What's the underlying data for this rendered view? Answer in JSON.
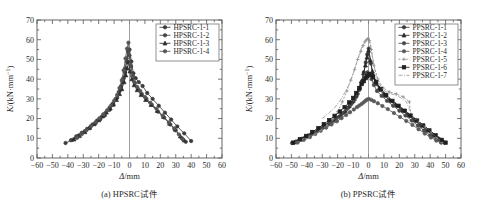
{
  "figure": {
    "background": "#ffffff",
    "axis_color": "#555555",
    "panels": [
      {
        "id": "panel-a",
        "caption": "(a) HPSRC试件",
        "chart_index": 0
      },
      {
        "id": "panel-b",
        "caption": "(b) PPSRC试件",
        "chart_index": 1
      }
    ]
  },
  "chart_data": [
    {
      "type": "line",
      "title": "",
      "subtitle": "",
      "xlabel": "Δ/mm",
      "ylabel": "K/(kN·mm⁻¹)",
      "ylabel_parts": {
        "italic": "K",
        "rest": "/(kN·mm",
        "sup": "−1",
        "close": ")"
      },
      "xlim": [
        -60,
        60
      ],
      "ylim": [
        0,
        70
      ],
      "xticks": [
        -60,
        -50,
        -40,
        -30,
        -20,
        -10,
        0,
        10,
        20,
        30,
        40,
        50,
        60
      ],
      "yticks": [
        0,
        10,
        20,
        30,
        40,
        50,
        60,
        70
      ],
      "xtick_labels": [
        "−60",
        "−50",
        "−40",
        "−30",
        "−20",
        "−10",
        "0",
        "10",
        "20",
        "30",
        "40",
        "50",
        "60"
      ],
      "ytick_labels": [
        "0",
        "10",
        "20",
        "30",
        "40",
        "50",
        "60",
        "70"
      ],
      "minor_ticks": true,
      "grid": false,
      "zero_vline": 0,
      "legend_position": "top-right",
      "series": [
        {
          "name": "HPSRC-1-1",
          "color": "#3a3a3a",
          "marker": "circle",
          "dash": "none",
          "x": [
            -41.5,
            -37,
            -33,
            -29,
            -25.5,
            -22,
            -19,
            -16,
            -13,
            -10.5,
            -8,
            -6,
            -4.5,
            -3,
            -1.8,
            -0.9,
            0,
            1.2,
            2.5,
            4,
            6,
            8.5,
            11.5,
            15,
            19,
            23,
            27,
            31,
            35.5,
            40
          ],
          "y": [
            7.6,
            9.2,
            11.4,
            13.6,
            15.6,
            17.6,
            19.6,
            21.6,
            24.4,
            27.0,
            30.5,
            34.5,
            38.5,
            43.5,
            49.0,
            54.0,
            55.0,
            49.0,
            43.0,
            40.5,
            38.5,
            36.5,
            33.0,
            30.0,
            26.5,
            23.0,
            19.5,
            16.0,
            12.5,
            8.6
          ]
        },
        {
          "name": "HPSRC-1-2",
          "color": "#444444",
          "marker": "circle",
          "dash": "none",
          "x": [
            -38,
            -34.5,
            -31,
            -27.5,
            -24,
            -21,
            -18,
            -15.5,
            -13,
            -11,
            -9,
            -7,
            -5.5,
            -4,
            -2.8,
            -1.8,
            -1.0,
            0,
            1.0,
            2.2,
            3.5,
            5.5,
            8,
            11,
            14.5,
            18.5,
            22.5,
            26.5,
            30,
            34,
            36.5
          ],
          "y": [
            9.0,
            11.0,
            12.8,
            14.8,
            17.0,
            19.0,
            21.0,
            23.0,
            25.5,
            27.5,
            30.0,
            33.5,
            36.5,
            40.5,
            45.5,
            50.5,
            54.5,
            52.0,
            46.5,
            41.0,
            38.0,
            35.0,
            32.5,
            30.0,
            27.0,
            23.5,
            20.5,
            17.0,
            14.0,
            10.0,
            8.2
          ]
        },
        {
          "name": "HPSRC-1-3",
          "color": "#2e2e2e",
          "marker": "triangle",
          "dash": "none",
          "x": [
            -36,
            -32.5,
            -29,
            -26,
            -23,
            -20,
            -17.5,
            -15,
            -12.5,
            -10.5,
            -8.5,
            -6.5,
            -5,
            -3.5,
            -2.4,
            -1.5,
            -0.6,
            0.3,
            1.5,
            3,
            5,
            7.5,
            10.5,
            14,
            18,
            22,
            26,
            29.5,
            33,
            35.5
          ],
          "y": [
            9.5,
            11.2,
            13.2,
            15.2,
            17.2,
            19.2,
            21.2,
            23.2,
            25.2,
            27.2,
            29.5,
            32.5,
            35.0,
            38.5,
            42.0,
            45.5,
            48.5,
            44.0,
            40.0,
            37.0,
            34.5,
            32.0,
            29.5,
            27.0,
            24.0,
            21.0,
            17.5,
            14.5,
            11.0,
            9.0
          ]
        },
        {
          "name": "HPSRC-1-4",
          "color": "#555555",
          "marker": "circle",
          "dash": "none",
          "x": [
            -34,
            -31,
            -28,
            -25,
            -22,
            -19.5,
            -17,
            -14.5,
            -12,
            -10,
            -8,
            -6.5,
            -5,
            -3.8,
            -2.6,
            -1.6,
            -0.7,
            0.5,
            1.8,
            3.2,
            5,
            7,
            10,
            13.5,
            17.5,
            21.5,
            25.5,
            29,
            32,
            34.5
          ],
          "y": [
            10.2,
            12.0,
            14.0,
            16.2,
            18.2,
            20.2,
            22.2,
            24.2,
            26.5,
            29.0,
            32.0,
            35.5,
            39.5,
            44.5,
            50.5,
            55.5,
            58.5,
            47.5,
            41.5,
            38.5,
            36.0,
            34.0,
            31.0,
            28.0,
            25.0,
            21.5,
            18.0,
            15.0,
            12.0,
            9.5
          ]
        }
      ],
      "legend_entries": [
        "HPSRC-1-1",
        "HPSRC-1-2",
        "HPSRC-1-3",
        "HPSRC-1-4"
      ]
    },
    {
      "type": "line",
      "title": "",
      "subtitle": "",
      "xlabel": "Δ/mm",
      "ylabel": "K/(kN·mm⁻¹)",
      "ylabel_parts": {
        "italic": "K",
        "rest": "/(kN·mm",
        "sup": "−1",
        "close": ")"
      },
      "xlim": [
        -60,
        60
      ],
      "ylim": [
        0,
        70
      ],
      "xticks": [
        -60,
        -50,
        -40,
        -30,
        -20,
        -10,
        0,
        10,
        20,
        30,
        40,
        50,
        60
      ],
      "yticks": [
        0,
        10,
        20,
        30,
        40,
        50,
        60,
        70
      ],
      "xtick_labels": [
        "−60",
        "−50",
        "−40",
        "−30",
        "−20",
        "−10",
        "0",
        "10",
        "20",
        "30",
        "40",
        "50",
        "60"
      ],
      "ytick_labels": [
        "0",
        "10",
        "20",
        "30",
        "40",
        "50",
        "60",
        "70"
      ],
      "minor_ticks": true,
      "grid": false,
      "zero_vline": 0,
      "legend_position": "top-right",
      "series": [
        {
          "name": "PPSRC-1-1",
          "color": "#3a3a3a",
          "marker": "circle",
          "dash": "none",
          "x": [
            -49.5,
            -45,
            -41,
            -37,
            -33,
            -29.5,
            -26,
            -22.5,
            -19,
            -16,
            -13,
            -10.5,
            -8,
            -6,
            -4.5,
            -3,
            -1.8,
            -0.8,
            0.2,
            1.5,
            3,
            5,
            7.5,
            10.5,
            14,
            18,
            22,
            26,
            30,
            34,
            38,
            42,
            46,
            49.5
          ],
          "y": [
            7.6,
            9.0,
            10.5,
            12.0,
            13.8,
            15.5,
            17.2,
            19.0,
            21.0,
            23.0,
            25.5,
            28.0,
            31.0,
            34.5,
            38.5,
            43.5,
            48.5,
            52.5,
            55.5,
            48.0,
            42.0,
            37.5,
            34.5,
            31.5,
            29.0,
            26.5,
            24.0,
            21.5,
            19.0,
            16.5,
            14.0,
            11.5,
            9.5,
            7.8
          ]
        },
        {
          "name": "PPSRC-1-2",
          "color": "#2b2b2b",
          "marker": "triangle",
          "dash": "none",
          "x": [
            -48,
            -44,
            -40,
            -36,
            -32,
            -28.5,
            -25,
            -21.5,
            -18,
            -15,
            -12.5,
            -10,
            -8,
            -6,
            -4.5,
            -3.2,
            -2,
            -1,
            0,
            1.2,
            2.5,
            4.5,
            7,
            10,
            13.5,
            17.5,
            21.5,
            25.5,
            29.5,
            33.5,
            37.5,
            41.5,
            45.5,
            48.5
          ],
          "y": [
            8.0,
            9.4,
            11.0,
            12.8,
            14.5,
            16.2,
            18.0,
            20.0,
            22.0,
            24.0,
            26.5,
            29.0,
            32.0,
            35.5,
            39.0,
            43.0,
            47.0,
            51.0,
            54.5,
            49.5,
            44.0,
            39.0,
            35.5,
            32.5,
            29.5,
            27.0,
            24.5,
            22.0,
            19.5,
            17.0,
            14.5,
            12.0,
            9.8,
            8.2
          ]
        },
        {
          "name": "PPSRC-1-3",
          "color": "#4a4a4a",
          "marker": "circle",
          "dash": "none",
          "x": [
            -47,
            -43,
            -39,
            -35,
            -31,
            -27.5,
            -24,
            -20.5,
            -17,
            -14,
            -11.5,
            -9,
            -7,
            -5.5,
            -4,
            -2.8,
            -1.6,
            -0.6,
            0.5,
            2,
            3.5,
            5.5,
            8.5,
            12,
            16,
            20,
            24,
            28,
            32,
            36,
            40,
            44,
            47.5
          ],
          "y": [
            8.4,
            9.8,
            11.4,
            13.0,
            14.8,
            16.5,
            18.4,
            20.4,
            22.5,
            24.8,
            27.0,
            29.5,
            32.5,
            35.5,
            38.0,
            40.5,
            42.5,
            43.5,
            42.5,
            40.0,
            37.0,
            34.0,
            31.5,
            29.0,
            26.5,
            24.0,
            21.5,
            19.0,
            16.5,
            14.0,
            11.5,
            9.4,
            8.0
          ]
        },
        {
          "name": "PPSRC-1-4",
          "color": "#5a5a5a",
          "marker": "circle",
          "dash": "none",
          "x": [
            -46,
            -42,
            -38,
            -34.5,
            -31,
            -27.5,
            -24,
            -20.5,
            -17.5,
            -14.5,
            -12,
            -9.5,
            -7.5,
            -6,
            -4.5,
            -3.2,
            -2,
            -1,
            0.2,
            1.8,
            3.5,
            6,
            9,
            12.5,
            16.5,
            20.5,
            24.5,
            28.5,
            32.5,
            36.5,
            40.5,
            44,
            47
          ],
          "y": [
            7.8,
            9.2,
            10.6,
            12.2,
            13.8,
            15.4,
            17.0,
            18.6,
            20.2,
            21.8,
            23.2,
            24.6,
            25.8,
            26.6,
            27.4,
            28.2,
            29.0,
            29.6,
            30.0,
            29.5,
            28.8,
            27.8,
            26.4,
            24.8,
            22.8,
            20.8,
            18.8,
            16.8,
            14.6,
            12.4,
            10.4,
            8.8,
            7.8
          ]
        },
        {
          "name": "PPSRC-1-5",
          "color": "#8a8a8a",
          "marker": "plus",
          "dash": "2,1.6",
          "x": [
            -50,
            -45,
            -40,
            -35,
            -31,
            -27,
            -23.5,
            -20,
            -17,
            -14,
            -11.5,
            -9,
            -7,
            -5,
            -3.5,
            -2.2,
            -1.2,
            -0.3,
            0.6,
            1.8,
            3.5,
            6,
            9.5,
            13.5,
            18,
            22.5,
            26.5,
            27.5,
            31,
            35,
            39.5,
            44,
            48
          ],
          "y": [
            7.4,
            8.8,
            10.2,
            12.0,
            14.0,
            16.5,
            19.5,
            23.5,
            28.5,
            34.0,
            39.5,
            45.0,
            50.0,
            54.0,
            57.0,
            59.0,
            60.0,
            60.5,
            59.5,
            55.0,
            47.0,
            40.0,
            35.5,
            33.5,
            32.5,
            31.0,
            28.5,
            22.0,
            19.5,
            16.5,
            13.5,
            10.5,
            8.2
          ]
        },
        {
          "name": "PPSRC-1-6",
          "color": "#1f1f1f",
          "marker": "square",
          "dash": "none",
          "x": [
            -49,
            -44.5,
            -40.5,
            -36.5,
            -32.5,
            -29,
            -25.5,
            -22,
            -18.5,
            -15.5,
            -12.5,
            -10,
            -8,
            -6,
            -4.5,
            -3,
            -1.8,
            -0.8,
            0.4,
            1.6,
            3,
            5,
            8,
            11.5,
            15.5,
            19.5,
            23.5,
            27.5,
            31.5,
            35.5,
            39.5,
            43.5,
            47.5,
            50
          ],
          "y": [
            7.8,
            9.6,
            11.2,
            13.2,
            15.2,
            17.2,
            19.2,
            21.4,
            23.6,
            25.8,
            28.2,
            30.5,
            33.0,
            35.5,
            37.5,
            39.0,
            40.5,
            41.5,
            42.5,
            42.0,
            41.0,
            38.5,
            35.0,
            32.0,
            29.0,
            26.5,
            24.0,
            21.5,
            19.0,
            16.5,
            14.0,
            11.5,
            9.2,
            7.8
          ]
        },
        {
          "name": "PPSRC-1-7",
          "color": "#9a9a9a",
          "marker": "none",
          "dash": "4,1.5,1,1.5",
          "x": [
            -30,
            -26,
            -22,
            -18.5,
            -15.5,
            -12.5,
            -10,
            -8,
            -6,
            -4.5,
            -3,
            -2,
            -1,
            0,
            1,
            2.2,
            4,
            6.5,
            9.5,
            13,
            17,
            21,
            24.5,
            27,
            29,
            32,
            36,
            40,
            44,
            47
          ],
          "y": [
            20.0,
            22.5,
            25.5,
            29.0,
            33.0,
            37.5,
            42.5,
            47.5,
            52.5,
            56.0,
            58.5,
            60.0,
            61.0,
            61.5,
            59.0,
            53.0,
            45.0,
            38.5,
            34.5,
            33.0,
            32.0,
            30.5,
            28.5,
            24.0,
            21.0,
            18.5,
            16.0,
            13.5,
            10.5,
            8.4
          ]
        }
      ],
      "legend_entries": [
        "PPSRC-1-1",
        "PPSRC-1-2",
        "PPSRC-1-3",
        "PPSRC-1-4",
        "PPSRC-1-5",
        "PPSRC-1-6",
        "PPSRC-1-7"
      ]
    }
  ]
}
